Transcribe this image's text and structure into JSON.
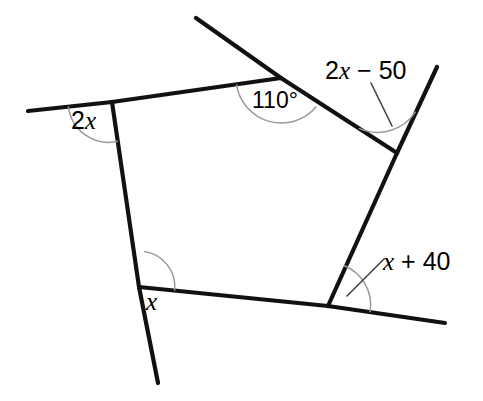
{
  "diagram": {
    "type": "geometry-figure",
    "background_color": "#ffffff",
    "line_color": "#111111",
    "arc_color": "#9a9a9a",
    "leader_color": "#444444",
    "vertices": [
      {
        "id": "A",
        "label_key": "angle_2x",
        "x": 112,
        "y": 102
      },
      {
        "id": "B",
        "label_key": "angle_110",
        "x": 281,
        "y": 78
      },
      {
        "id": "C",
        "label_key": "angle_2x_m50",
        "x": 397,
        "y": 153
      },
      {
        "id": "D",
        "label_key": "angle_x_p40",
        "x": 328,
        "y": 306
      },
      {
        "id": "E",
        "label_key": "angle_x",
        "x": 139,
        "y": 287
      }
    ],
    "sides": [
      {
        "name": "side-A-B",
        "from": "A",
        "to": "B"
      },
      {
        "name": "side-B-C",
        "from": "B",
        "to": "C"
      },
      {
        "name": "side-C-D",
        "from": "C",
        "to": "D"
      },
      {
        "name": "side-D-E",
        "from": "D",
        "to": "E"
      },
      {
        "name": "side-E-A",
        "from": "E",
        "to": "A"
      }
    ],
    "extension_rays": [
      {
        "name": "ray-from-A-left",
        "from": "A",
        "x": 28,
        "y": 111
      },
      {
        "name": "ray-from-B-upleft",
        "from": "B",
        "x": 196,
        "y": 18
      },
      {
        "name": "ray-from-C-upright",
        "from": "C",
        "x": 437,
        "y": 67
      },
      {
        "name": "ray-from-D-right",
        "from": "D",
        "x": 445,
        "y": 323
      },
      {
        "name": "ray-from-E-down",
        "from": "E",
        "x": 158,
        "y": 383
      }
    ]
  },
  "labels": {
    "angle_2x": {
      "coef": "2",
      "variable": "x",
      "operator": "",
      "constant": "",
      "full": "2x"
    },
    "angle_110": {
      "coef": "",
      "variable": "",
      "operator": "",
      "constant": "",
      "full": "110°"
    },
    "angle_2x_m50": {
      "coef": "2",
      "variable": "x",
      "operator": "−",
      "constant": "50",
      "full": "2x − 50"
    },
    "angle_x_p40": {
      "coef": "",
      "variable": "x",
      "operator": "+",
      "constant": "40",
      "full": "x + 40"
    },
    "angle_x": {
      "coef": "",
      "variable": "x",
      "operator": "",
      "constant": "",
      "full": "x"
    }
  },
  "angles": [
    {
      "name": "arc-2x",
      "at_vertex": "A",
      "label": "2x",
      "has_leader": false
    },
    {
      "name": "arc-110",
      "at_vertex": "B",
      "label": "110°",
      "has_leader": false,
      "measure_degrees": 110
    },
    {
      "name": "arc-2x-50",
      "at_vertex": "C",
      "label": "2x − 50",
      "has_leader": true
    },
    {
      "name": "arc-x-40",
      "at_vertex": "D",
      "label": "x + 40",
      "has_leader": true
    },
    {
      "name": "arc-x",
      "at_vertex": "E",
      "label": "x",
      "has_leader": false
    }
  ]
}
